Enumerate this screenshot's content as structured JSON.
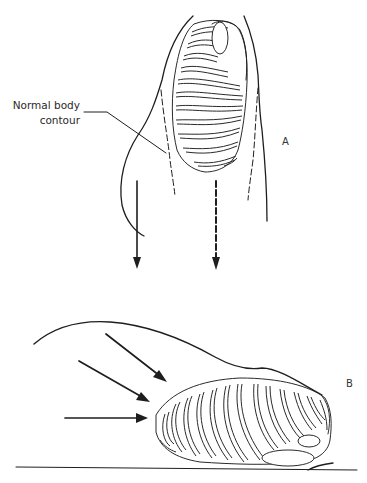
{
  "figure": {
    "panel_a": {
      "label": "A",
      "callout": {
        "line1": "Normal body",
        "line2": "contour"
      }
    },
    "panel_b": {
      "label": "B"
    }
  },
  "colors": {
    "ink": "#1e1e1e",
    "background": "#ffffff"
  }
}
